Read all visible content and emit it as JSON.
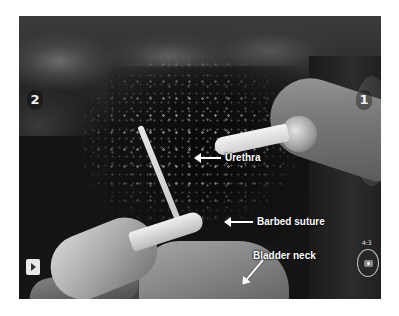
{
  "view": {
    "type": "robotic-surgery-endoscope-frame",
    "color_mode": "grayscale"
  },
  "instruments": [
    {
      "id": "instrument-2",
      "number": "2",
      "position": "left"
    },
    {
      "id": "instrument-1",
      "number": "1",
      "position": "right"
    }
  ],
  "annotations": {
    "urethra": "Urethra",
    "barbed_suture": "Barbed suture",
    "bladder_neck": "Bladder neck"
  },
  "controls": {
    "play_icon": "play-icon",
    "aspect_ratio": "4:3",
    "camera_icon": "camera-icon"
  },
  "colors": {
    "page_background": "#ffffff",
    "frame_background": "#141414",
    "label_text": "#ffffff"
  }
}
